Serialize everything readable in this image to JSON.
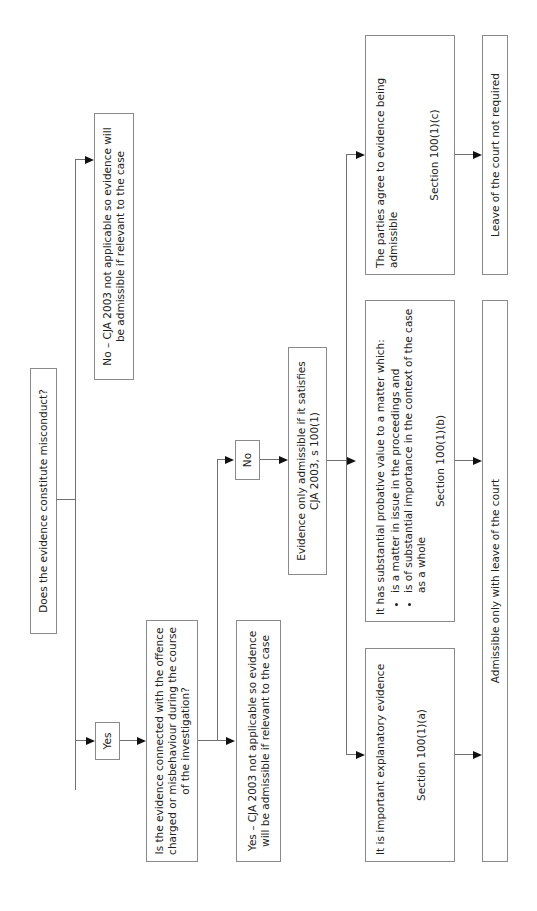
{
  "flowchart": {
    "start": {
      "text": "Does the evidence constitute misconduct?"
    },
    "no_branch": {
      "text": "No – CJA 2003 not applicable so evidence will be admissible if relevant to the case"
    },
    "yes_label": {
      "text": "Yes"
    },
    "connected_question": {
      "text": "Is the evidence connected with the offence charged or misbehaviour during the course of the investigation?"
    },
    "yes_connected": {
      "text": "Yes – CJA 2003 not applicable so evidence will be admissible if relevant to the case"
    },
    "no_label": {
      "text": "No"
    },
    "s100_gate": {
      "text": "Evidence only admissible if it satisfies CJA 2003, s 100(1)"
    },
    "option_a": {
      "text": "It is important explanatory evidence",
      "section": "Section 100(1)(a)"
    },
    "option_b": {
      "text": "It has substantial probative value to a matter which:",
      "bullets": [
        "is a matter in issue in the proceedings and",
        "is of substantial importance in the context of the case as a whole"
      ],
      "section": "Section 100(1)(b)"
    },
    "option_c": {
      "text": "The parties agree to evidence being admissible",
      "section": "Section 100(1)(c)"
    },
    "outcome_leave": {
      "text": "Admissible only with leave of the court"
    },
    "outcome_no_leave": {
      "text": "Leave of the court not required"
    }
  }
}
